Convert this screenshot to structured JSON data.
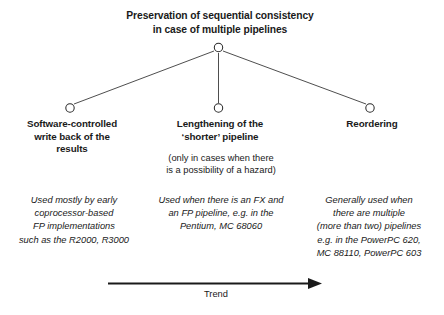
{
  "diagram": {
    "title": "Preservation of sequential consistency\nin case of multiple pipelines",
    "branches": [
      {
        "label": "Software-controlled\nwrite back of the\nresults",
        "note": "",
        "description": "Used mostly by early\ncoprocessor-based\nFP implementations\nsuch as the R2000, R3000"
      },
      {
        "label": "Lengthening of the\n‘shorter’ pipeline",
        "note": "(only in cases when there\nis a possibility of a hazard)",
        "description": "Used when there is an FX and\nan FP pipeline, e.g. in the\nPentium, MC 68060"
      },
      {
        "label": "Reordering",
        "note": "",
        "description": "Generally used when\nthere are multiple\n(more than two) pipelines\ne.g. in the PowerPC 620,\nMC 88110, PowerPC 603"
      }
    ],
    "trend_axis": {
      "label": "Trend"
    },
    "colors": {
      "ink": "#1a1a1a",
      "line": "#3a3a3a",
      "node_fill": "#ffffff",
      "background": "#ffffff"
    }
  }
}
